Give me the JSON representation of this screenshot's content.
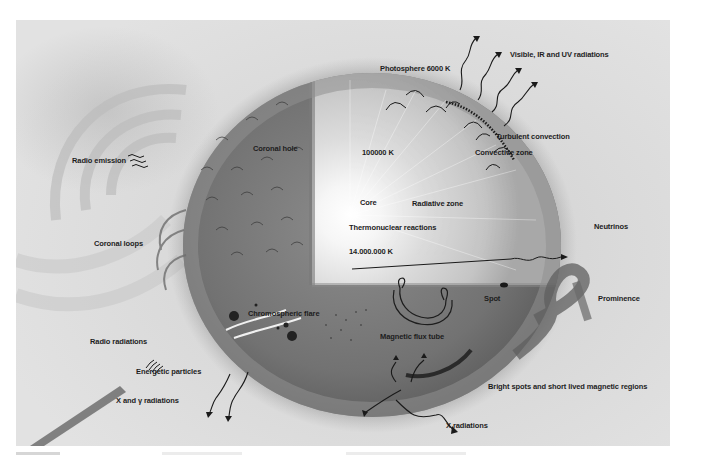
{
  "figure": {
    "colors": {
      "background": "#dcdcdc",
      "sphere_outer": "#8a8a8a",
      "sphere_dark": "#5e5e5e",
      "core_glow": "#ffffff",
      "ink": "#1d1d1d"
    }
  },
  "labels": {
    "radio_emission": "Radio emission",
    "coronal_hole": "Coronal hole",
    "coronal_loops": "Coronal loops",
    "radio_radiations": "Radio radiations",
    "energetic_particles": "Energetic particles",
    "x_gamma_radiations": "X and γ radiations",
    "photosphere": "Photosphere 6000 K",
    "visible_ir_uv": "Visible, IR and UV radiations",
    "turbulent_convection": "Turbulent convection",
    "convective_zone": "Convective zone",
    "temp_100000": "100000 K",
    "core": "Core",
    "radiative_zone": "Radiative zone",
    "thermonuclear": "Thermonuclear reactions",
    "temp_core": "14.000.000 K",
    "neutrinos": "Neutrinos",
    "chromospheric_flare": "Chromospheric flare",
    "magnetic_flux_tube": "Magnetic flux tube",
    "spot": "Spot",
    "prominence": "Prominence",
    "bright_spots": "Bright spots and short lived magnetic regions",
    "x_radiations": "X radiations"
  }
}
